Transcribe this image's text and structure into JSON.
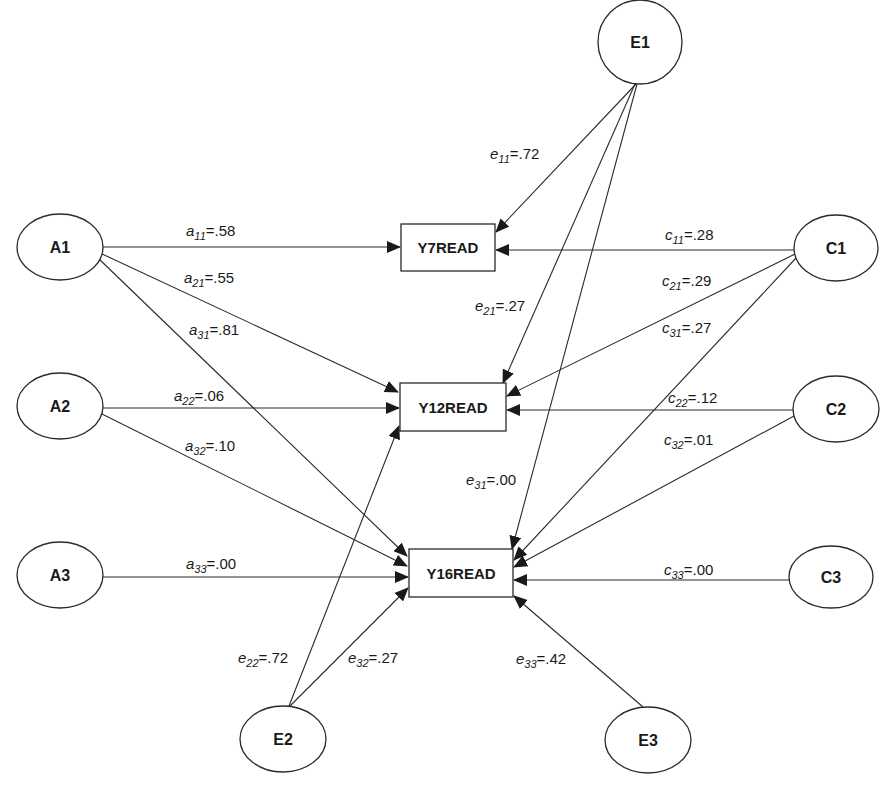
{
  "diagram": {
    "type": "path-diagram",
    "latent_nodes": [
      {
        "id": "A1",
        "label": "A1",
        "cx": 60,
        "cy": 247
      },
      {
        "id": "A2",
        "label": "A2",
        "cx": 60,
        "cy": 406
      },
      {
        "id": "A3",
        "label": "A3",
        "cx": 60,
        "cy": 575
      },
      {
        "id": "C1",
        "label": "C1",
        "cx": 836,
        "cy": 248
      },
      {
        "id": "C2",
        "label": "C2",
        "cx": 836,
        "cy": 409
      },
      {
        "id": "C3",
        "label": "C3",
        "cx": 831,
        "cy": 577
      },
      {
        "id": "E1",
        "label": "E1",
        "cx": 640,
        "cy": 42
      },
      {
        "id": "E2",
        "label": "E2",
        "cx": 283,
        "cy": 739
      },
      {
        "id": "E3",
        "label": "E3",
        "cx": 648,
        "cy": 740
      }
    ],
    "observed_nodes": [
      {
        "id": "Y7READ",
        "label": "Y7READ",
        "x": 401,
        "y": 224,
        "w": 94,
        "h": 47
      },
      {
        "id": "Y12READ",
        "label": "Y12READ",
        "x": 400,
        "y": 383,
        "w": 106,
        "h": 48
      },
      {
        "id": "Y16READ",
        "label": "Y16READ",
        "x": 409,
        "y": 549,
        "w": 104,
        "h": 48
      }
    ],
    "paths": [
      {
        "from": "A1",
        "to": "Y7READ",
        "symbol": "a",
        "sub": "11",
        "value": "=.58"
      },
      {
        "from": "A1",
        "to": "Y12READ",
        "symbol": "a",
        "sub": "21",
        "value": "=.55"
      },
      {
        "from": "A1",
        "to": "Y16READ",
        "symbol": "a",
        "sub": "31",
        "value": "=.81"
      },
      {
        "from": "A2",
        "to": "Y12READ",
        "symbol": "a",
        "sub": "22",
        "value": "=.06"
      },
      {
        "from": "A2",
        "to": "Y16READ",
        "symbol": "a",
        "sub": "32",
        "value": "=.10"
      },
      {
        "from": "A3",
        "to": "Y16READ",
        "symbol": "a",
        "sub": "33",
        "value": "=.00"
      },
      {
        "from": "C1",
        "to": "Y7READ",
        "symbol": "c",
        "sub": "11",
        "value": "=.28"
      },
      {
        "from": "C1",
        "to": "Y12READ",
        "symbol": "c",
        "sub": "21",
        "value": "=.29"
      },
      {
        "from": "C1",
        "to": "Y16READ",
        "symbol": "c",
        "sub": "31",
        "value": "=.27"
      },
      {
        "from": "C2",
        "to": "Y12READ",
        "symbol": "c",
        "sub": "22",
        "value": "=.12"
      },
      {
        "from": "C2",
        "to": "Y16READ",
        "symbol": "c",
        "sub": "32",
        "value": "=.01"
      },
      {
        "from": "C3",
        "to": "Y16READ",
        "symbol": "c",
        "sub": "33",
        "value": "=.00"
      },
      {
        "from": "E1",
        "to": "Y7READ",
        "symbol": "e",
        "sub": "11",
        "value": "=.72"
      },
      {
        "from": "E1",
        "to": "Y12READ",
        "symbol": "e",
        "sub": "21",
        "value": "=.27"
      },
      {
        "from": "E1",
        "to": "Y16READ",
        "symbol": "e",
        "sub": "31",
        "value": "=.00"
      },
      {
        "from": "E2",
        "to": "Y12READ",
        "symbol": "e",
        "sub": "22",
        "value": "=.72"
      },
      {
        "from": "E2",
        "to": "Y16READ",
        "symbol": "e",
        "sub": "32",
        "value": "=.27"
      },
      {
        "from": "E3",
        "to": "Y16READ",
        "symbol": "e",
        "sub": "33",
        "value": "=.42"
      }
    ]
  },
  "labels": {
    "A1": "A1",
    "A2": "A2",
    "A3": "A3",
    "C1": "C1",
    "C2": "C2",
    "C3": "C3",
    "E1": "E1",
    "E2": "E2",
    "E3": "E3",
    "Y7READ": "Y7READ",
    "Y12READ": "Y12READ",
    "Y16READ": "Y16READ",
    "a11": {
      "sym": "a",
      "sub": "11",
      "val": "=.58"
    },
    "a21": {
      "sym": "a",
      "sub": "21",
      "val": "=.55"
    },
    "a31": {
      "sym": "a",
      "sub": "31",
      "val": "=.81"
    },
    "a22": {
      "sym": "a",
      "sub": "22",
      "val": "=.06"
    },
    "a32": {
      "sym": "a",
      "sub": "32",
      "val": "=.10"
    },
    "a33": {
      "sym": "a",
      "sub": "33",
      "val": "=.00"
    },
    "c11": {
      "sym": "c",
      "sub": "11",
      "val": "=.28"
    },
    "c21": {
      "sym": "c",
      "sub": "21",
      "val": "=.29"
    },
    "c31": {
      "sym": "c",
      "sub": "31",
      "val": "=.27"
    },
    "c22": {
      "sym": "c",
      "sub": "22",
      "val": "=.12"
    },
    "c32": {
      "sym": "c",
      "sub": "32",
      "val": "=.01"
    },
    "c33": {
      "sym": "c",
      "sub": "33",
      "val": "=.00"
    },
    "e11": {
      "sym": "e",
      "sub": "11",
      "val": "=.72"
    },
    "e21": {
      "sym": "e",
      "sub": "21",
      "val": "=.27"
    },
    "e31": {
      "sym": "e",
      "sub": "31",
      "val": "=.00"
    },
    "e22": {
      "sym": "e",
      "sub": "22",
      "val": "=.72"
    },
    "e32": {
      "sym": "e",
      "sub": "32",
      "val": "=.27"
    },
    "e33": {
      "sym": "e",
      "sub": "33",
      "val": "=.42"
    }
  },
  "colors": {
    "stroke": "#2a2a2a",
    "text": "#1a1a1a",
    "background": "#ffffff"
  }
}
